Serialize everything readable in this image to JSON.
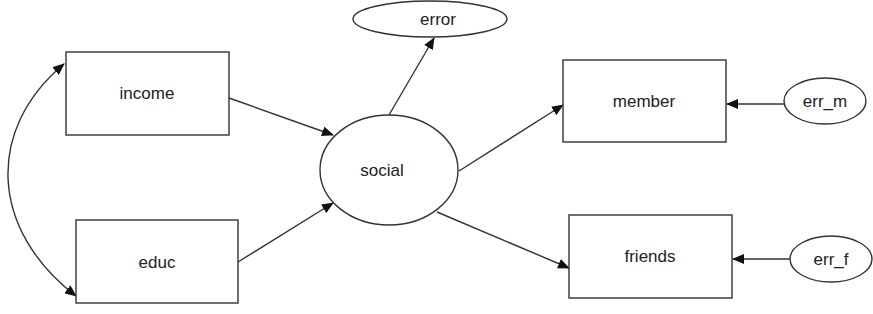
{
  "diagram": {
    "type": "structural-equation-model",
    "nodes": [
      {
        "id": "income",
        "label": "income",
        "shape": "rect",
        "x": 66,
        "y": 52,
        "w": 163,
        "h": 83
      },
      {
        "id": "educ",
        "label": "educ",
        "shape": "rect",
        "x": 76,
        "y": 220,
        "w": 162,
        "h": 83
      },
      {
        "id": "social",
        "label": "social",
        "shape": "ellipse",
        "cx": 389,
        "cy": 170,
        "rx": 69,
        "ry": 55
      },
      {
        "id": "error",
        "label": "error",
        "shape": "ellipse",
        "cx": 430,
        "cy": 18,
        "rx": 77,
        "ry": 18
      },
      {
        "id": "member",
        "label": "member",
        "shape": "rect",
        "x": 563,
        "y": 60,
        "w": 163,
        "h": 82
      },
      {
        "id": "friends",
        "label": "friends",
        "shape": "rect",
        "x": 569,
        "y": 215,
        "w": 163,
        "h": 83
      },
      {
        "id": "err_m",
        "label": "err_m",
        "shape": "ellipse",
        "cx": 825,
        "cy": 101,
        "rx": 41,
        "ry": 23
      },
      {
        "id": "err_f",
        "label": "err_f",
        "shape": "ellipse",
        "cx": 831,
        "cy": 259,
        "rx": 41,
        "ry": 23
      }
    ],
    "edges": [
      {
        "from": "income",
        "to": "social",
        "type": "directed"
      },
      {
        "from": "educ",
        "to": "social",
        "type": "directed"
      },
      {
        "from": "social",
        "to": "error",
        "type": "directed"
      },
      {
        "from": "social",
        "to": "member",
        "type": "directed"
      },
      {
        "from": "social",
        "to": "friends",
        "type": "directed"
      },
      {
        "from": "err_m",
        "to": "member",
        "type": "directed"
      },
      {
        "from": "err_f",
        "to": "friends",
        "type": "directed"
      },
      {
        "from": "income",
        "to": "educ",
        "type": "bidirectional-curved"
      }
    ],
    "colors": {
      "stroke": "#333333",
      "fill": "#ffffff",
      "text": "#222222"
    }
  }
}
